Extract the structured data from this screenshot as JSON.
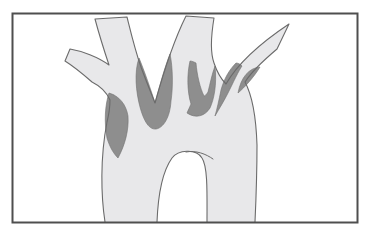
{
  "figure": {
    "colors": {
      "background": "#ffffff",
      "frame_border": "#4f4f4f",
      "vessel_fill": "#e8e8ea",
      "vessel_outline": "#6b6b6b",
      "plaque_fill": "#8e8e8e",
      "plaque_outline": "#707070",
      "none": "none"
    },
    "frame": {
      "x": "12.5",
      "y": "13.5",
      "width": "345",
      "height": "209",
      "stroke_width": "2"
    },
    "shapes": {
      "vessel_fill_path": "M 105 222 C 101 196 100 158 107 122 C 109 114 110 107 110 100 C 107 93 100 86 92 82 C 84 75 73 66 65 61 L 70 49 C 82 51 98 57 109 65 C 104 50 99 34 95 19 L 127 17 C 131 33 135 50 141 67 C 146 81 152 95 155 103 C 160 85 172 44 186 16 L 214 18 C 211 36 210 52 214 63 C 217 72 221 79 226 84 C 238 63 262 42 289 24 L 277 49 C 264 60 252 71 245 82 C 252 95 256 115 257 145 C 257 175 256 200 255 222 L 207 222 C 207 195 208 167 202 158 C 196 148 178 150 172 158 C 162 172 158 196 157 222 Z",
      "vessel_outline_path": "M 105 222 C 101 196 100 158 107 122 C 109 114 110 107 110 100 C 107 93 100 86 92 82 C 84 75 73 66 65 61 L 70 49 C 82 51 98 57 109 65 C 104 50 99 34 95 19 L 127 17 C 131 33 135 50 141 67 C 146 81 152 95 155 103 C 160 85 172 44 186 16 L 214 18 C 211 36 210 52 214 63 C 217 72 221 79 226 84 C 238 63 262 42 289 24 L 277 49 C 264 60 252 71 245 82 C 252 95 256 115 257 145 C 257 175 256 200 255 222",
      "inner_arch_path": "M 157 222 C 158 196 162 172 172 158 C 178 150 196 148 202 158 C 208 167 207 195 207 222",
      "inner_arch_flick_path": "M 186 152 C 196 150 206 154 213 159",
      "plaques": [
        {
          "name": "plaque-left-wall",
          "path": "M 109 93 C 105 105 104 122 107 138 C 110 148 114 154 118 158 C 125 145 129 130 128 116 C 126 104 119 96 109 93 Z"
        },
        {
          "name": "plaque-innominate-bifurcation",
          "path": "M 139 58 C 144 70 151 90 155 103 C 160 85 165 66 170 54 C 173 68 173 88 171 101 C 170 118 163 128 156 129 C 148 130 143 118 140 107 C 136 92 134 72 139 58 Z"
        },
        {
          "name": "plaque-carotid-origin",
          "path": "M 190 61 C 187 74 187 91 191 104 C 190 107 188 110 187 113 C 196 119 205 116 210 108 C 214 99 217 85 215 66 C 212 74 210 84 208 92 C 206 95 205 96 204 96 C 200 88 197 75 196 63 C 194 62 192 61 190 61 Z"
        },
        {
          "name": "plaque-subclavian-origin",
          "path": "M 236 63 C 229 70 224 79 221 90 C 219 100 217 109 215 116 C 219 109 224 101 228 93 C 233 83 239 70 242 66 C 240 64 238 63 236 63 Z"
        },
        {
          "name": "plaque-arch-shoulder",
          "path": "M 238 93 C 245 87 254 77 260 67 C 249 68 241 77 238 93 Z"
        }
      ]
    },
    "stroke_widths": {
      "vessel": "1.1",
      "flick": "1",
      "plaque": "0.6"
    }
  }
}
